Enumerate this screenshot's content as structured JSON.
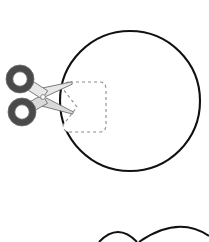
{
  "illustration": {
    "title": "Scissors cutting a dashed patch out of a circle",
    "canvas": {
      "width": 209,
      "height": 242,
      "background": "#ffffff"
    },
    "colors": {
      "outline": "#111111",
      "dashed_guide": "#8a8a8a",
      "blade_fill": "#d9d9d9",
      "blade_fill_light": "#e8e8e8",
      "blade_stroke": "#6e6e6e",
      "handle_dark": "#4a4a4a",
      "handle_ring_inner": "#ffffff",
      "pivot": "#8a8a8a",
      "page_background": "#ffffff"
    },
    "shapes": {
      "main_circle": {
        "name": "main-circle",
        "center_x": 130,
        "center_y": 101,
        "radius": 70,
        "stroke_width": 2.1,
        "fill": "none"
      },
      "cut_patch": {
        "name": "cut-patch-dashed-outline",
        "left": 63,
        "top": 82,
        "right": 106,
        "bottom": 132,
        "corner_radius": 7,
        "dash_pattern": "3 3",
        "stroke_width": 1.1,
        "notch_depth": 14,
        "notch_center_y": 107
      },
      "scissors": {
        "name": "scissors",
        "pivot_x": 43,
        "pivot_y": 97,
        "pivot_radius": 2.4,
        "upper_handle_ring": {
          "cx": 20,
          "cy": 79,
          "outer_r": 14,
          "inner_r": 7.2
        },
        "lower_handle_ring": {
          "cx": 22,
          "cy": 112,
          "outer_r": 14,
          "inner_r": 7.2
        },
        "upper_blade_tip_x": 72,
        "upper_blade_tip_y": 83,
        "lower_blade_tip_x": 73,
        "lower_blade_tip_y": 113
      },
      "bottom_arc_small": {
        "name": "bottom-arc-small",
        "start_x": 99,
        "start_y": 242,
        "peak_x": 118,
        "peak_y": 232,
        "end_x": 137,
        "end_y": 242,
        "stroke_width": 2.0
      },
      "bottom_arc_large": {
        "name": "bottom-arc-large",
        "start_x": 139,
        "start_y": 242,
        "peak_x": 178,
        "peak_y": 227,
        "end_x": 209,
        "end_y": 236,
        "stroke_width": 2.0
      }
    }
  }
}
